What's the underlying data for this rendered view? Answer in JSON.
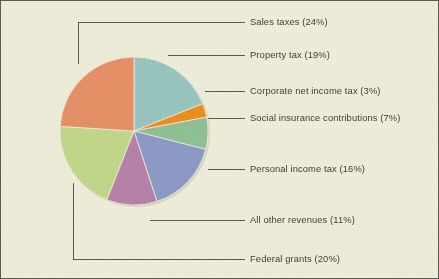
{
  "figure": {
    "background_color": "#f1f0dc",
    "border_color": "#5a5c52",
    "label_text_color": "#3c3f3a",
    "leader_line_color": "#4a4d45"
  },
  "chart_data": {
    "type": "pie",
    "title": "",
    "subtitle": "",
    "xlabel": "",
    "ylabel": "",
    "legend_position": "callout-labels-right",
    "grid": false,
    "units": "percent",
    "total": 100,
    "start_angle_deg": 0,
    "direction": "clockwise",
    "categories": [
      "Property tax",
      "Corporate net income tax",
      "Social insurance contributions",
      "Personal income tax",
      "All other revenues",
      "Federal grants",
      "Sales taxes"
    ],
    "values": [
      19,
      3,
      7,
      16,
      11,
      20,
      24
    ],
    "colors": [
      "#9ac8c3",
      "#f0901e",
      "#92c296",
      "#8e9cca",
      "#b984ac",
      "#c4da8d",
      "#e99269"
    ],
    "slices": [
      {
        "label": "Sales taxes (24%)",
        "name": "Sales taxes",
        "value": 24,
        "color": "#e99269"
      },
      {
        "label": "Property tax (19%)",
        "name": "Property tax",
        "value": 19,
        "color": "#9ac8c3"
      },
      {
        "label": "Corporate net income tax (3%)",
        "name": "Corporate net income tax",
        "value": 3,
        "color": "#f0901e"
      },
      {
        "label": "Social insurance contributions (7%)",
        "name": "Social insurance contributions",
        "value": 7,
        "color": "#92c296"
      },
      {
        "label": "Personal income tax (16%)",
        "name": "Personal income tax",
        "value": 16,
        "color": "#8e9cca"
      },
      {
        "label": "All other revenues (11%)",
        "name": "All other revenues",
        "value": 11,
        "color": "#b984ac"
      },
      {
        "label": "Federal grants (20%)",
        "name": "Federal grants",
        "value": 20,
        "color": "#c4da8d"
      }
    ]
  },
  "callouts": {
    "sales_taxes": "Sales taxes (24%)",
    "property_tax": "Property tax (19%)",
    "corporate_net_income_tax": "Corporate net income tax (3%)",
    "social_insurance_contributions": "Social insurance contributions (7%)",
    "personal_income_tax": "Personal income tax (16%)",
    "all_other_revenues": "All other revenues (11%)",
    "federal_grants": "Federal grants (20%)"
  }
}
